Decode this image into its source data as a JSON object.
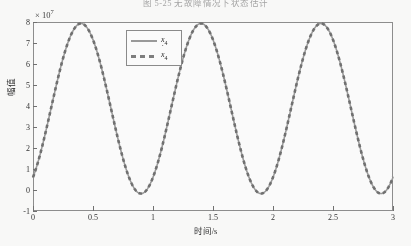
{
  "page": {
    "caption": "图 5-25   无故障情况下状态估计"
  },
  "figure": {
    "exponent_label_prefix": "× 10",
    "exponent_label_power": "7",
    "xaxis_title": "时间/s",
    "yaxis_title": "幅值",
    "legend": [
      {
        "name": "x4-series",
        "label_base": "x",
        "label_sub": "4",
        "dot": false,
        "style": "solid"
      },
      {
        "name": "x4dot-series",
        "label_base": "x",
        "label_sub": "4",
        "dot": true,
        "style": "dashed"
      }
    ]
  },
  "chart_data": {
    "type": "line",
    "title": "",
    "xlabel": "时间/s",
    "ylabel": "幅值",
    "xlim": [
      0,
      3
    ],
    "ylim": [
      -1,
      8
    ],
    "y_scale": 10000000.0,
    "y_scale_label": "×10⁷",
    "xticks": [
      0,
      0.5,
      1,
      1.5,
      2,
      2.5,
      3
    ],
    "xticklabels": [
      "0",
      "0.5",
      "1",
      "1.5",
      "2",
      "2.5",
      "3"
    ],
    "yticks": [
      -1,
      0,
      1,
      2,
      3,
      4,
      5,
      6,
      7,
      8
    ],
    "yticklabels": [
      "-1",
      "0",
      "1",
      "2",
      "3",
      "4",
      "5",
      "6",
      "7",
      "8"
    ],
    "grid": false,
    "legend_position": "upper-center-left",
    "series": [
      {
        "name": "x₄",
        "style": "solid",
        "color": "#9a9a9a",
        "description": "Sinusoidal state response, period 1 s, amplitude about 4.05e7 offset 3.9e7, peaks near 7.9e7 at t=0.40, 1.40, 2.40 and troughs near -0.3e7 at t=0.90, 1.90, 2.90",
        "amplitude": 4.05,
        "offset": 3.88,
        "period": 1.0,
        "phase_shift": 0.15,
        "x": [
          0,
          0.1,
          0.2,
          0.3,
          0.4,
          0.5,
          0.6,
          0.7,
          0.8,
          0.9,
          1.0,
          1.1,
          1.2,
          1.3,
          1.4,
          1.5,
          1.6,
          1.7,
          1.8,
          1.9,
          2.0,
          2.1,
          2.2,
          2.3,
          2.4,
          2.5,
          2.6,
          2.7,
          2.8,
          2.9,
          3.0
        ],
        "y": [
          0.0,
          1.1,
          3.4,
          6.1,
          7.85,
          7.6,
          6.0,
          3.4,
          1.0,
          -0.25,
          0.05,
          1.1,
          3.4,
          6.1,
          7.85,
          7.6,
          6.0,
          3.4,
          1.0,
          -0.25,
          0.05,
          1.1,
          3.4,
          6.1,
          7.85,
          7.6,
          6.0,
          3.4,
          1.0,
          -0.25,
          0.05
        ]
      },
      {
        "name": "ẋ₄",
        "style": "dashed",
        "color": "#7d7d7d",
        "description": "Estimated state, overlaps the true state almost exactly",
        "amplitude": 4.05,
        "offset": 3.88,
        "period": 1.0,
        "phase_shift": 0.15,
        "x": [
          0,
          0.1,
          0.2,
          0.3,
          0.4,
          0.5,
          0.6,
          0.7,
          0.8,
          0.9,
          1.0,
          1.1,
          1.2,
          1.3,
          1.4,
          1.5,
          1.6,
          1.7,
          1.8,
          1.9,
          2.0,
          2.1,
          2.2,
          2.3,
          2.4,
          2.5,
          2.6,
          2.7,
          2.8,
          2.9,
          3.0
        ],
        "y": [
          0.0,
          1.1,
          3.4,
          6.1,
          7.85,
          7.6,
          6.0,
          3.4,
          1.0,
          -0.25,
          0.05,
          1.1,
          3.4,
          6.1,
          7.85,
          7.6,
          6.0,
          3.4,
          1.0,
          -0.25,
          0.05,
          1.1,
          3.4,
          6.1,
          7.85,
          7.6,
          6.0,
          3.4,
          1.0,
          -0.25,
          0.05
        ]
      }
    ]
  }
}
